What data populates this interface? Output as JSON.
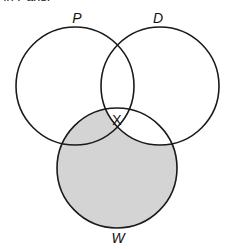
{
  "caption": {
    "text": "in Paris."
  },
  "diagram": {
    "type": "venn",
    "sets": [
      {
        "id": "P",
        "label": "P",
        "cx": 75,
        "cy": 86,
        "r": 59
      },
      {
        "id": "D",
        "label": "D",
        "cx": 160,
        "cy": 86,
        "r": 59
      },
      {
        "id": "W",
        "label": "W",
        "cx": 117,
        "cy": 168,
        "r": 60
      }
    ],
    "region_marker": {
      "label": "X",
      "region": "P∩D∩W"
    },
    "shaded_region": "W minus D",
    "colors": {
      "stroke": "#1a1a1a",
      "shade": "#d4d4d4",
      "background": "#ffffff"
    }
  }
}
